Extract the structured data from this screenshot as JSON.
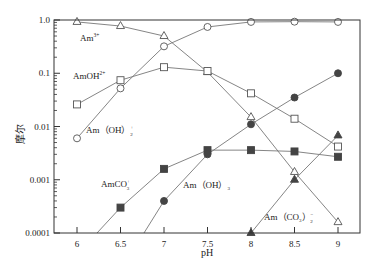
{
  "chart_data": {
    "type": "line",
    "title": "",
    "xlabel": "pH",
    "ylabel": "摩尔",
    "yscale": "log",
    "xlim": [
      5.75,
      9.25
    ],
    "ylim": [
      0.0001,
      1.0
    ],
    "x_ticks": [
      "6",
      "6.5",
      "7",
      "7.5",
      "8",
      "8.5",
      "9"
    ],
    "y_ticks": [
      "1.0",
      "0.1",
      "0.01",
      "0.001",
      "0.0001"
    ],
    "grid": false,
    "legend": "inline labels",
    "x": [
      6,
      6.5,
      7,
      7.5,
      8,
      8.5,
      9
    ],
    "series": [
      {
        "name": "Am3+",
        "label": "Am³⁺",
        "marker": "open-triangle",
        "values": [
          0.92,
          0.77,
          0.5,
          0.105,
          0.015,
          0.0014,
          0.00016
        ]
      },
      {
        "name": "AmOH2+",
        "label": "AmOH²⁺",
        "marker": "open-square",
        "values": [
          0.026,
          0.074,
          0.13,
          0.11,
          0.042,
          0.014,
          0.0042
        ]
      },
      {
        "name": "Am(OH)2+",
        "label": "Am（OH）₂⁺",
        "marker": "open-circle",
        "values": [
          0.006,
          0.052,
          0.32,
          0.74,
          0.92,
          0.93,
          0.92
        ]
      },
      {
        "name": "AmCO3+",
        "label": "AmCO₃⁺",
        "marker": "filled-square",
        "x": [
          6.23,
          6.5,
          7,
          7.5,
          8,
          8.5,
          9
        ],
        "values": [
          0.0001,
          0.0003,
          0.0016,
          0.0036,
          0.0036,
          0.0034,
          0.0027
        ]
      },
      {
        "name": "Am(OH)3",
        "label": "Am（OH）₃",
        "marker": "filled-circle",
        "x": [
          6.77,
          7,
          7.5,
          8,
          8.5,
          9
        ],
        "values": [
          0.0001,
          0.0004,
          0.003,
          0.011,
          0.035,
          0.1
        ]
      },
      {
        "name": "Am(CO3)2-",
        "label": "Am（CO₃）₂⁻",
        "marker": "filled-triangle",
        "x": [
          8,
          8.5,
          9
        ],
        "values": [
          0.0001,
          0.001,
          0.0068
        ]
      }
    ]
  },
  "labels": {
    "am3": "Am",
    "am3_sup": "3+",
    "amoh": "AmOH",
    "amoh_sup": "2+",
    "amoh2": "Am（OH）",
    "amoh2_sub": "2",
    "amoh2_sup": "+",
    "amco3": "AmCO",
    "amco3_sub": "3",
    "amco3_sup": "+",
    "amoh3": "Am（OH）",
    "amoh3_sub": "3",
    "amco32": "Am（CO",
    "amco32_sub1": "3",
    "amco32_mid": "）",
    "amco32_sub2": "2",
    "amco32_sup": "−"
  },
  "colors": {
    "line": "#777777",
    "axis": "#333333",
    "filled_marker": "#444444",
    "open_marker_fill": "#ffffff"
  }
}
